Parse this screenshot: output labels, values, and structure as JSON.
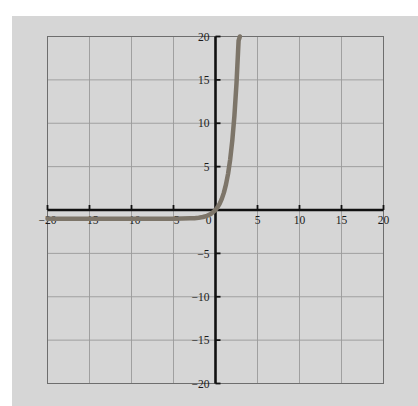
{
  "chart_data": {
    "type": "line",
    "title": "",
    "xlabel": "",
    "ylabel": "",
    "xlim": [
      -20,
      20
    ],
    "ylim": [
      -20,
      20
    ],
    "grid": true,
    "grid_step": 5,
    "legend": "none",
    "x_ticks": [
      -20,
      -15,
      -10,
      -5,
      0,
      5,
      10,
      15,
      20
    ],
    "x_tick_labels": [
      "−20",
      "−15",
      "−10",
      "−5",
      "0",
      "5",
      "10",
      "15",
      "20"
    ],
    "y_ticks": [
      -20,
      -15,
      -10,
      -5,
      5,
      10,
      15,
      20
    ],
    "y_tick_labels": [
      "−20",
      "−15",
      "−10",
      "−5",
      "5",
      "10",
      "15",
      "20"
    ],
    "series": [
      {
        "name": "exponential-curve",
        "color": "#7d7569",
        "line_width": 4.5,
        "description": "Exponential growth curve: flat near y = -1 for x < -2, crossing y = 0 just right of x = 0, rising steeply to y = 20 near x = 2.9",
        "x": [
          -20,
          -18,
          -16,
          -14,
          -12,
          -10,
          -8,
          -6,
          -5,
          -4,
          -3,
          -2.5,
          -2,
          -1.5,
          -1,
          -0.5,
          0,
          0.25,
          0.5,
          0.75,
          1,
          1.25,
          1.5,
          1.75,
          2,
          2.25,
          2.5,
          2.75,
          2.9
        ],
        "y": [
          -1.0,
          -1.0,
          -1.0,
          -1.0,
          -1.0,
          -1.0,
          -1.0,
          -1.0,
          -1.0,
          -0.99,
          -0.96,
          -0.94,
          -0.89,
          -0.81,
          -0.67,
          -0.42,
          0.0,
          0.32,
          0.73,
          1.28,
          2.0,
          2.95,
          4.2,
          5.84,
          8.0,
          10.84,
          14.59,
          19.52,
          20.0
        ]
      }
    ]
  },
  "axes": {
    "x_axis_name": "horizontal-axis",
    "y_axis_name": "vertical-axis",
    "axis_color": "#111111",
    "grid_color": "#9a9a9a",
    "frame_color": "#6e6e6e",
    "background_color": "#d6d6d6",
    "page_color": "#ffffff"
  }
}
